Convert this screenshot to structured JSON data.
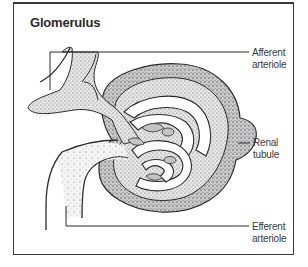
{
  "diagram": {
    "title": "Glomerulus",
    "labels": [
      {
        "id": "afferent",
        "line1": "Afferent",
        "line2": "arteriole"
      },
      {
        "id": "renal",
        "line1": "Renal",
        "line2": "tubule"
      },
      {
        "id": "efferent",
        "line1": "Efferent",
        "line2": "arteriole"
      }
    ],
    "colors": {
      "stroke": "#2b2b2b",
      "stipple_fill": "#d9d9d9",
      "capsule_fill": "#cfcfcf",
      "background": "#ffffff"
    }
  }
}
